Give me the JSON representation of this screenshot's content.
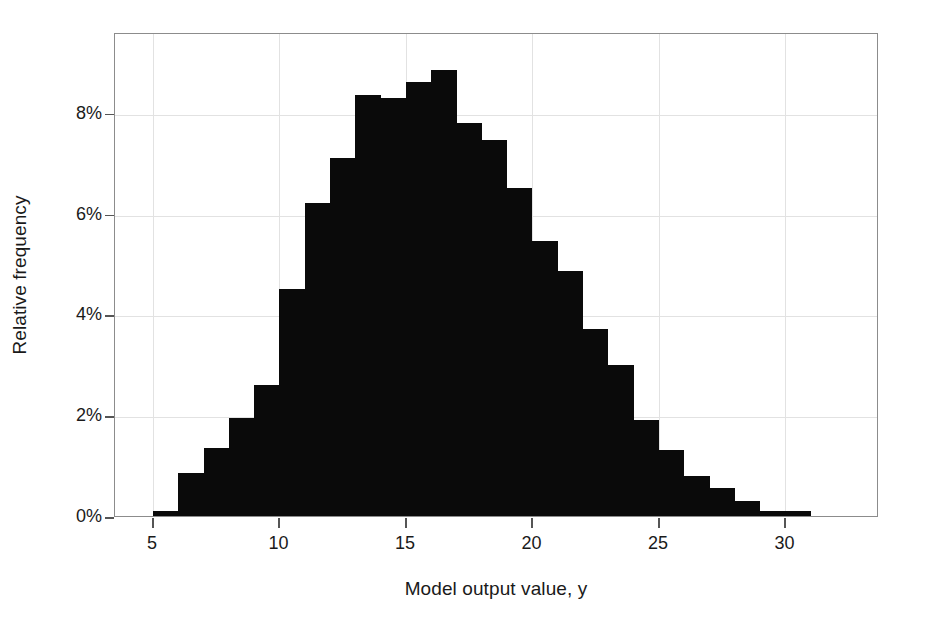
{
  "chart_data": {
    "type": "bar",
    "title": "",
    "subtitle": "",
    "xlabel": "Model output value, y",
    "ylabel": "Relative frequency",
    "xlim": [
      3.5,
      33.7
    ],
    "ylim": [
      0,
      9.6
    ],
    "grid": true,
    "legend": null,
    "bar_color": "#0a0a0a",
    "bin_width": 1,
    "x_ticks": [
      5,
      10,
      15,
      20,
      25,
      30
    ],
    "x_tick_labels": [
      "5",
      "10",
      "15",
      "20",
      "25",
      "30"
    ],
    "y_ticks": [
      0,
      2,
      4,
      6,
      8
    ],
    "y_tick_labels": [
      "0%",
      "2%",
      "4%",
      "6%",
      "8%"
    ],
    "bin_edges": [
      5,
      6,
      7,
      8,
      9,
      10,
      11,
      12,
      13,
      14,
      15,
      16,
      17,
      18,
      19,
      20,
      21,
      22,
      23,
      24,
      25,
      26,
      27,
      28,
      29,
      30,
      31
    ],
    "categories": [
      "5-6",
      "6-7",
      "7-8",
      "8-9",
      "9-10",
      "10-11",
      "11-12",
      "12-13",
      "13-14",
      "14-15",
      "15-16",
      "16-17",
      "17-18",
      "18-19",
      "19-20",
      "20-21",
      "21-22",
      "22-23",
      "23-24",
      "24-25",
      "25-26",
      "26-27",
      "27-28",
      "28-29",
      "29-30",
      "30-31"
    ],
    "values": [
      0.1,
      0.85,
      1.35,
      1.95,
      2.6,
      4.5,
      6.2,
      7.1,
      8.35,
      8.3,
      8.6,
      8.85,
      7.8,
      7.45,
      6.5,
      5.45,
      4.85,
      3.7,
      3.0,
      1.9,
      1.3,
      0.8,
      0.55,
      0.3,
      0.1,
      0.1
    ],
    "ylabel_unit": "%"
  },
  "axes": {
    "y_title": "Relative frequency",
    "x_title": "Model output value, y"
  }
}
